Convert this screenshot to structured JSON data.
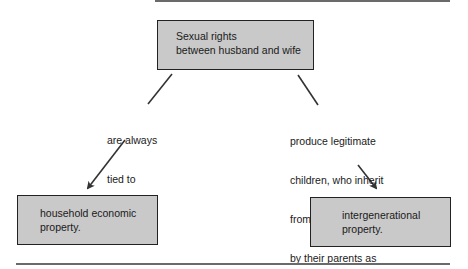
{
  "diagram": {
    "type": "concept-map",
    "nodes": {
      "top": {
        "line1": "Sexual rights",
        "line2": "between husband and wife"
      },
      "left": {
        "line1": "household economic",
        "line2": "property."
      },
      "right": {
        "line1": "intergenerational",
        "line2": "property."
      }
    },
    "edges": {
      "left": {
        "from": "top",
        "to": "left",
        "line1": "are always",
        "line2": "tied to"
      },
      "right": {
        "from": "top",
        "to": "right",
        "line1": "produce legitimate",
        "line2": "children, who inherit",
        "line3": "from and are controlled",
        "line4": "by their parents as"
      }
    },
    "colors": {
      "box_fill": "#c9c9c9",
      "box_border": "#222222",
      "arrow": "#333333",
      "rule": "#6a6a6a"
    }
  }
}
